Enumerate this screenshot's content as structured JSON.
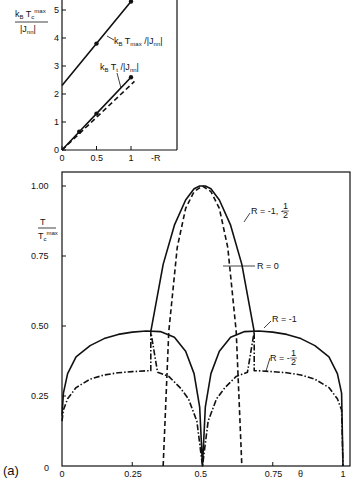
{
  "chart_data": [
    {
      "type": "line",
      "title": "",
      "xlabel": "-R",
      "ylabel": "k_B T_c^max / |J_nn|",
      "xlim": [
        0,
        1.35
      ],
      "ylim": [
        0,
        5.4
      ],
      "xticks": [
        "0",
        "0.5",
        "1"
      ],
      "yticks": [
        "0",
        "1",
        "2",
        "3",
        "4",
        "5"
      ],
      "grid": false,
      "series": [
        {
          "name": "k_B T_max / |J_nn|",
          "style": "solid",
          "x": [
            0,
            0.5,
            1.0
          ],
          "y": [
            2.3,
            3.8,
            5.3
          ],
          "markers_at": [
            0.5,
            1.0
          ]
        },
        {
          "name": "k_B T_t / |J_nn|",
          "style": "solid",
          "x": [
            0,
            0.25,
            0.5,
            1.0
          ],
          "y": [
            0,
            0.65,
            1.3,
            2.6
          ],
          "markers_at": [
            0.25,
            0.5,
            1.0
          ]
        },
        {
          "name": "k_B T_t / |J_nn| (dashed)",
          "style": "dashed",
          "x": [
            0,
            1.05
          ],
          "y": [
            0,
            2.45
          ]
        }
      ],
      "annotations": [
        "k_B T_max / |J_nn|",
        "k_B T_t / |J_nn|"
      ]
    },
    {
      "type": "line",
      "title": "",
      "panel_label": "(a)",
      "xlabel": "θ",
      "ylabel": "T / T_c^max",
      "xlim": [
        0,
        1
      ],
      "ylim": [
        0,
        1.05
      ],
      "xticks": [
        "0",
        "0.25",
        "0.5",
        "0.75",
        "1"
      ],
      "yticks": [
        "0",
        "0.25",
        "0.50",
        "0.75",
        "1.00"
      ],
      "grid": false,
      "series": [
        {
          "name": "R = -1, -1/2",
          "style": "solid",
          "x": [
            0.316,
            0.36,
            0.4,
            0.44,
            0.47,
            0.49,
            0.5,
            0.51,
            0.53,
            0.56,
            0.6,
            0.64,
            0.684
          ],
          "y": [
            0.48,
            0.72,
            0.86,
            0.95,
            0.99,
            1.0,
            1.0,
            1.0,
            0.99,
            0.95,
            0.86,
            0.72,
            0.48
          ]
        },
        {
          "name": "R = 0",
          "style": "dashed",
          "x": [
            0.36,
            0.38,
            0.41,
            0.44,
            0.47,
            0.5,
            0.53,
            0.56,
            0.59,
            0.62,
            0.64
          ],
          "y": [
            0.0,
            0.48,
            0.78,
            0.92,
            0.98,
            1.0,
            0.98,
            0.92,
            0.78,
            0.48,
            0.0
          ]
        },
        {
          "name": "R = -1",
          "style": "solid",
          "x": [
            0,
            0.005,
            0.02,
            0.05,
            0.1,
            0.15,
            0.2,
            0.25,
            0.3,
            0.35,
            0.4,
            0.44,
            0.47,
            0.49,
            0.5,
            0.51,
            0.53,
            0.56,
            0.6,
            0.65,
            0.7,
            0.75,
            0.8,
            0.85,
            0.9,
            0.95,
            0.98,
            0.995,
            1.0
          ],
          "y": [
            0.18,
            0.26,
            0.33,
            0.39,
            0.43,
            0.455,
            0.47,
            0.478,
            0.482,
            0.48,
            0.46,
            0.41,
            0.33,
            0.21,
            0.0,
            0.21,
            0.33,
            0.41,
            0.46,
            0.48,
            0.482,
            0.478,
            0.47,
            0.455,
            0.43,
            0.39,
            0.33,
            0.26,
            0.0
          ]
        },
        {
          "name": "R = -1/2",
          "style": "dashdot",
          "x": [
            0,
            0.005,
            0.02,
            0.05,
            0.1,
            0.15,
            0.2,
            0.25,
            0.3,
            0.316,
            0.316,
            0.34,
            0.38,
            0.42,
            0.45,
            0.48,
            0.5,
            0.52,
            0.55,
            0.58,
            0.62,
            0.66,
            0.684,
            0.684,
            0.7,
            0.75,
            0.8,
            0.85,
            0.9,
            0.95,
            0.98,
            0.995,
            1.0
          ],
          "y": [
            0.16,
            0.2,
            0.24,
            0.28,
            0.31,
            0.325,
            0.333,
            0.337,
            0.34,
            0.34,
            0.48,
            0.335,
            0.32,
            0.28,
            0.24,
            0.16,
            0.0,
            0.16,
            0.24,
            0.28,
            0.32,
            0.335,
            0.48,
            0.34,
            0.34,
            0.337,
            0.333,
            0.325,
            0.31,
            0.28,
            0.24,
            0.2,
            0.0
          ]
        }
      ],
      "annotations": [
        "R = -1, -1/2",
        "R = 0",
        "R = -1",
        "R = -1/2"
      ]
    }
  ],
  "labels": {
    "top_ylabel_num": "k",
    "top_ylabel_den": "|J",
    "top_xlabel": "-R",
    "top_ann_tmax": "k",
    "top_ann_tt": "k",
    "main_ylabel_num": "T",
    "main_ylabel_den": "T",
    "main_xlabel": "θ",
    "panel": "(a)",
    "ann_r_m1_mhalf": "R = -1, -",
    "ann_r0": "R = 0",
    "ann_rm1": "R = -1",
    "ann_rmhalf": "R = -"
  }
}
